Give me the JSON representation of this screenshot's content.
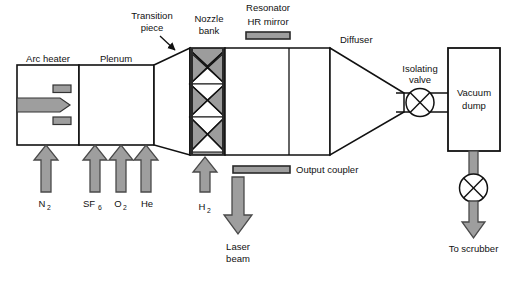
{
  "diagram": {
    "colors": {
      "outline": "#111111",
      "fill_white": "#ffffff",
      "gray_fill": "#9e9e9e",
      "gray_dark": "#7d7d7d",
      "arrow_stroke": "#4a4a4a",
      "nozzle_gray": "#9c9c9c"
    },
    "components": [
      {
        "id": "arc-heater",
        "label": "Arc heater"
      },
      {
        "id": "plenum",
        "label": "Plenum"
      },
      {
        "id": "transition-piece",
        "label": "Transition\npiece",
        "line1": "Transition",
        "line2": "piece"
      },
      {
        "id": "nozzle-bank",
        "label": "Nozzle\nbank",
        "line1": "Nozzle",
        "line2": "bank"
      },
      {
        "id": "resonator-hr-mirror",
        "label": "Resonator\nHR mirror",
        "line1": "Resonator",
        "line2": "HR mirror"
      },
      {
        "id": "diffuser",
        "label": "Diffuser"
      },
      {
        "id": "isolating-valve",
        "label": "Isolating\nvalve",
        "line1": "Isolating",
        "line2": "valve"
      },
      {
        "id": "vacuum-dump",
        "label": "Vacuum\ndump",
        "line1": "Vacuum",
        "line2": "dump"
      },
      {
        "id": "output-coupler",
        "label": "Output coupler"
      },
      {
        "id": "laser-beam",
        "label": "Laser\nbeam",
        "line1": "Laser",
        "line2": "beam"
      },
      {
        "id": "to-scrubber",
        "label": "To scrubber"
      }
    ],
    "inlet_gases": [
      {
        "id": "n2",
        "base": "N",
        "sub": "2",
        "x": 46
      },
      {
        "id": "sf6",
        "base": "SF",
        "sub": "6",
        "x": 95
      },
      {
        "id": "o2",
        "base": "O",
        "sub": "2",
        "x": 121
      },
      {
        "id": "he",
        "base": "He",
        "sub": "",
        "x": 146
      }
    ],
    "secondary_inlet": {
      "id": "h2",
      "base": "H",
      "sub": "2",
      "x": 205
    },
    "labels": {
      "arc_heater": "Arc heater",
      "plenum": "Plenum",
      "transition_l1": "Transition",
      "transition_l2": "piece",
      "nozzle_l1": "Nozzle",
      "nozzle_l2": "bank",
      "resonator_l1": "Resonator",
      "resonator_l2": "HR mirror",
      "diffuser": "Diffuser",
      "isolating_l1": "Isolating",
      "isolating_l2": "valve",
      "vacuum_l1": "Vacuum",
      "vacuum_l2": "dump",
      "output_coupler": "Output coupler",
      "laser_l1": "Laser",
      "laser_l2": "beam",
      "to_scrubber": "To scrubber",
      "n2_base": "N",
      "n2_sub": "2",
      "sf6_base": "SF",
      "sf6_sub": "6",
      "o2_base": "O",
      "o2_sub": "2",
      "he_base": "He",
      "h2_base": "H",
      "h2_sub": "2"
    }
  }
}
